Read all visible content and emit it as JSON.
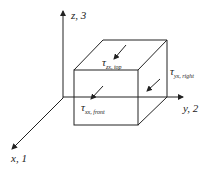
{
  "diagram": {
    "type": "stress-element-cube",
    "axes": {
      "z": {
        "label": "z, 3"
      },
      "y": {
        "label": "y, 2"
      },
      "x": {
        "label": "x, 1"
      }
    },
    "stresses": {
      "top": {
        "symbol": "τ",
        "subscript": "zx, top"
      },
      "right": {
        "symbol": "τ",
        "subscript": "yx, right"
      },
      "front": {
        "symbol": "τ",
        "subscript": "xx, front"
      }
    },
    "colors": {
      "stroke": "#222222",
      "background": "#ffffff"
    }
  }
}
